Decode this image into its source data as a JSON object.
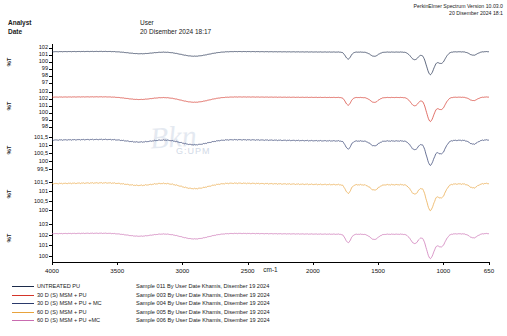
{
  "header": {
    "analyst_label": "Analyst",
    "date_label": "Date",
    "analyst_value": "User",
    "date_value": "20 Disember 2024 18:17",
    "software_line1": "PerkinElmer Spectrum Version 10.03.0",
    "software_line2": "20 Disember 2024 18:1"
  },
  "watermark": {
    "text": "Bkn",
    "sub": "G:UPM"
  },
  "chart_data": {
    "type": "line",
    "title": "",
    "xlabel": "cm-1",
    "ylabel": "%T",
    "xlim": [
      4000,
      650
    ],
    "x_ticks": [
      4000,
      3500,
      3000,
      2500,
      2000,
      1500,
      1000,
      650
    ],
    "x_tick_labels": [
      "4000",
      "3500",
      "3000",
      "2500",
      "2000",
      "1500",
      "1000",
      "650"
    ],
    "axis_direction": "reversed",
    "grid": false,
    "legend_position": "below-plot",
    "panels": [
      {
        "index": 0,
        "name": "UNTREATED PU",
        "color": "#1c2b4a",
        "y_ticks": [
          102,
          101,
          100,
          99,
          98,
          97
        ],
        "y_tick_labels": [
          "102",
          "101",
          "100",
          "99",
          "98",
          "97"
        ],
        "ylim": [
          96.5,
          102.5
        ],
        "ylabel": "%T",
        "baseline": 101.4,
        "peaks": [
          {
            "cm": 3320,
            "depth": 0.35
          },
          {
            "cm": 2940,
            "depth": 0.45
          },
          {
            "cm": 2860,
            "depth": 0.3
          },
          {
            "cm": 1730,
            "depth": 1.0
          },
          {
            "cm": 1530,
            "depth": 0.6
          },
          {
            "cm": 1220,
            "depth": 1.1
          },
          {
            "cm": 1100,
            "depth": 3.2
          },
          {
            "cm": 1015,
            "depth": 1.6
          },
          {
            "cm": 770,
            "depth": 0.5
          }
        ]
      },
      {
        "index": 1,
        "name": "30 D (S) MSM + PU",
        "color": "#d4352a",
        "y_ticks": [
          103,
          102,
          101,
          100,
          99,
          98
        ],
        "y_tick_labels": [
          "103",
          "102",
          "101",
          "100",
          "99",
          "98"
        ],
        "ylim": [
          97.5,
          103.5
        ],
        "ylabel": "%T",
        "baseline": 102.2,
        "peaks": [
          {
            "cm": 3330,
            "depth": 0.4
          },
          {
            "cm": 2940,
            "depth": 0.5
          },
          {
            "cm": 2860,
            "depth": 0.35
          },
          {
            "cm": 1730,
            "depth": 1.1
          },
          {
            "cm": 1530,
            "depth": 0.7
          },
          {
            "cm": 1220,
            "depth": 1.2
          },
          {
            "cm": 1100,
            "depth": 3.4
          },
          {
            "cm": 1015,
            "depth": 1.7
          },
          {
            "cm": 770,
            "depth": 0.5
          }
        ]
      },
      {
        "index": 2,
        "name": "30 D (S) MSM + PU + MC",
        "color": "#2b3a6b",
        "y_ticks": [
          101.5,
          101,
          100.5,
          100,
          99.5
        ],
        "y_tick_labels": [
          "101,5",
          "101",
          "100,5",
          "100",
          "99,5"
        ],
        "ylim": [
          99.2,
          101.8
        ],
        "ylabel": "%T",
        "baseline": 101.3,
        "peaks": [
          {
            "cm": 3330,
            "depth": 0.18
          },
          {
            "cm": 2940,
            "depth": 0.22
          },
          {
            "cm": 2860,
            "depth": 0.15
          },
          {
            "cm": 1730,
            "depth": 0.5
          },
          {
            "cm": 1530,
            "depth": 0.3
          },
          {
            "cm": 1220,
            "depth": 0.55
          },
          {
            "cm": 1100,
            "depth": 1.5
          },
          {
            "cm": 1015,
            "depth": 0.8
          },
          {
            "cm": 770,
            "depth": 0.25
          }
        ]
      },
      {
        "index": 3,
        "name": "60 D (S) MSM + PU",
        "color": "#e8a33d",
        "y_ticks": [
          101.5,
          101,
          100.5,
          100
        ],
        "y_tick_labels": [
          "101,5",
          "101",
          "100,5",
          "100"
        ],
        "ylim": [
          99.6,
          101.8
        ],
        "ylabel": "%T",
        "baseline": 101.4,
        "peaks": [
          {
            "cm": 3330,
            "depth": 0.15
          },
          {
            "cm": 2940,
            "depth": 0.2
          },
          {
            "cm": 2860,
            "depth": 0.14
          },
          {
            "cm": 1730,
            "depth": 0.45
          },
          {
            "cm": 1530,
            "depth": 0.28
          },
          {
            "cm": 1220,
            "depth": 0.5
          },
          {
            "cm": 1100,
            "depth": 1.35
          },
          {
            "cm": 1015,
            "depth": 0.7
          },
          {
            "cm": 770,
            "depth": 0.22
          }
        ]
      },
      {
        "index": 4,
        "name": "60 D (S) MSM + PU +MC",
        "color": "#c96bb0",
        "y_ticks": [
          103,
          102,
          101,
          100
        ],
        "y_tick_labels": [
          "103",
          "102",
          "101",
          "100"
        ],
        "ylim": [
          99.4,
          103.4
        ],
        "ylabel": "%T",
        "baseline": 102.1,
        "peaks": [
          {
            "cm": 3330,
            "depth": 0.3
          },
          {
            "cm": 2940,
            "depth": 0.35
          },
          {
            "cm": 2860,
            "depth": 0.25
          },
          {
            "cm": 1730,
            "depth": 0.8
          },
          {
            "cm": 1530,
            "depth": 0.5
          },
          {
            "cm": 1220,
            "depth": 0.9
          },
          {
            "cm": 1100,
            "depth": 2.3
          },
          {
            "cm": 1015,
            "depth": 1.2
          },
          {
            "cm": 770,
            "depth": 0.4
          }
        ]
      }
    ]
  },
  "legend": {
    "rows": [
      {
        "color": "#1c2b4a",
        "name": "UNTREATED PU",
        "desc": "Sample 011 By User Date Khamis, Disember 19 2024"
      },
      {
        "color": "#d4352a",
        "name": "30 D (S) MSM + PU",
        "desc": "Sample 003 By User Date Khamis, Disember 19 2024"
      },
      {
        "color": "#2b3a6b",
        "name": "30 D (S) MSM + PU + MC",
        "desc": "Sample 004 By User Date Khamis, Disember 19 2024"
      },
      {
        "color": "#e8a33d",
        "name": "60 D (S) MSM + PU",
        "desc": "Sample 005 By User Date Khamis, Disember 19 2024"
      },
      {
        "color": "#c96bb0",
        "name": "60 D (S) MSM + PU +MC",
        "desc": "Sample 006 By User Date Khamis, Disember 19 2024"
      }
    ]
  }
}
